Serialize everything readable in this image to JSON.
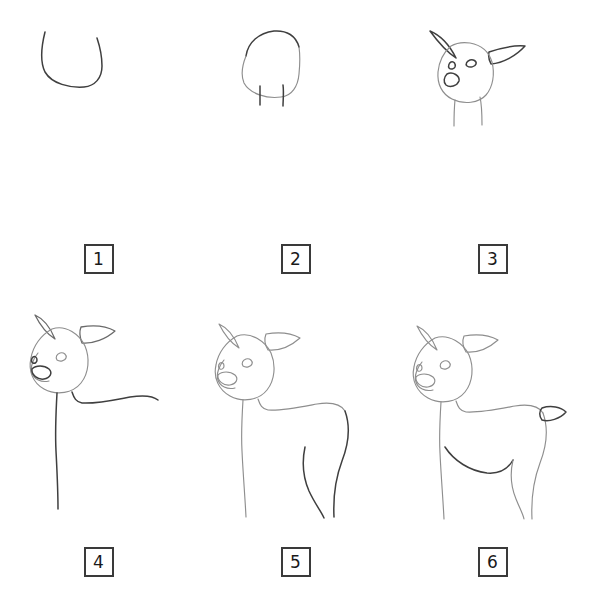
{
  "sheet": {
    "title": "How to draw a deer - step by step",
    "background_color": "#ffffff",
    "columns": 3,
    "rows": 2,
    "line_color_light": "#8e8e8e",
    "line_color_dark": "#3f3f3f",
    "box_border_color": "#3a3a3a",
    "number_text_color": "#1a1a1a"
  },
  "steps": [
    {
      "number": "1",
      "name": "step-1",
      "description": "U-shaped muzzle and jaw outline curve"
    },
    {
      "number": "2",
      "name": "step-2",
      "description": "Rounded head shape closed at top with two short neck lines"
    },
    {
      "number": "3",
      "name": "step-3",
      "description": "Head with two pointed ears, two eyes and a nose added"
    },
    {
      "number": "4",
      "name": "step-4",
      "description": "Tilted head with muzzle, long front neck line and back line"
    },
    {
      "number": "5",
      "name": "step-5",
      "description": "Head, neck, back, chest and hind leg outlines"
    },
    {
      "number": "6",
      "name": "step-6",
      "description": "Complete deer body with belly line, four legs and small tail"
    }
  ]
}
